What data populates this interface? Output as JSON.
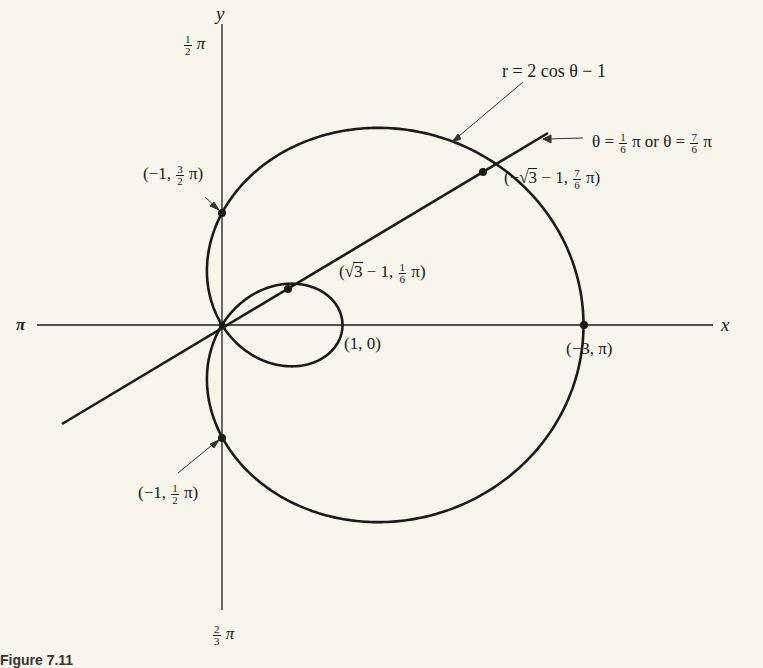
{
  "figure": {
    "caption_partial": "Figure 7.11",
    "curve_equation": "r = 2 cos θ − 1",
    "line_equation": {
      "prefix": "θ = ",
      "frac1": {
        "num": "1",
        "den": "6"
      },
      "middle": " π or θ = ",
      "frac2": {
        "num": "7",
        "den": "6"
      },
      "suffix": " π"
    },
    "axes": {
      "x_label": "x",
      "y_label": "y",
      "top_label": {
        "num": "1",
        "den": "2",
        "suffix": " π"
      },
      "bottom_label": {
        "num": "2",
        "den": "3",
        "suffix": " π"
      },
      "left_label": "π"
    },
    "points": [
      {
        "id": "p-neg1-3half-pi",
        "text_pre": "(−1, ",
        "num": "3",
        "den": "2",
        "text_post": " π)",
        "r": -1,
        "theta": "3π/2"
      },
      {
        "id": "p-neg1-half-pi",
        "text_pre": "(−1, ",
        "num": "1",
        "den": "2",
        "text_post": " π)",
        "r": -1,
        "theta": "π/2"
      },
      {
        "id": "p-sqrt3-minus1-sixth-pi",
        "text_pre": "(",
        "sqrt": "3",
        "text_mid": " − 1, ",
        "num": "1",
        "den": "6",
        "text_post": " π)",
        "r": "√3 − 1",
        "theta": "π/6"
      },
      {
        "id": "p-neg-sqrt3-minus1-7sixth-pi",
        "text_pre": "(−",
        "sqrt": "3",
        "text_mid": " − 1, ",
        "num": "7",
        "den": "6",
        "text_post": " π)",
        "r": "−√3 − 1",
        "theta": "7π/6"
      },
      {
        "id": "p-1-0",
        "text": "(1, 0)",
        "r": 1,
        "theta": "0"
      },
      {
        "id": "p-neg3-pi",
        "text": "(−3, π)",
        "r": -3,
        "theta": "π"
      }
    ],
    "colors": {
      "background": "#f7f5ec",
      "ink": "#1a1a1a"
    }
  }
}
